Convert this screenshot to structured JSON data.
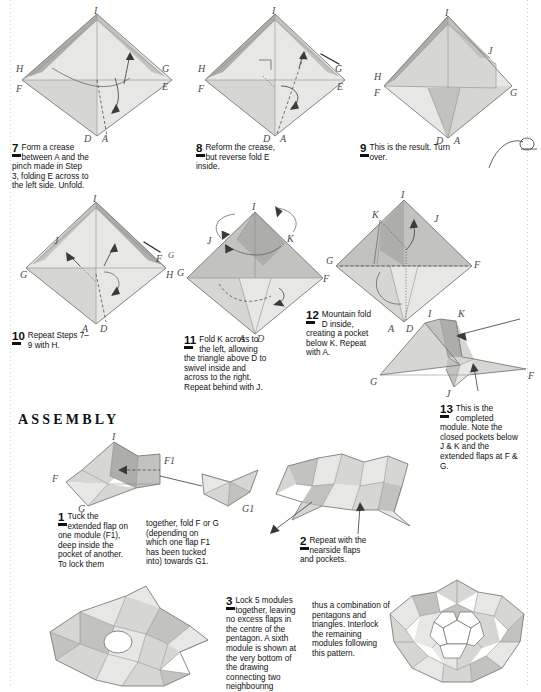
{
  "page": {
    "section_heading": "ASSEMBLY"
  },
  "steps": [
    {
      "number": "7",
      "text": "Form a crease between A and the pinch made in Step 3, folding E across to the left side. Unfold.",
      "labels": [
        "I",
        "H",
        "G",
        "F",
        "E",
        "D",
        "A"
      ]
    },
    {
      "number": "8",
      "text": "Reform the crease, but reverse fold E inside.",
      "labels": [
        "I",
        "H",
        "G",
        "F",
        "E",
        "D",
        "A"
      ]
    },
    {
      "number": "9",
      "text": "This is the result. Turn over.",
      "labels": [
        "I",
        "J",
        "H",
        "G",
        "F",
        "D",
        "A"
      ]
    },
    {
      "number": "10",
      "text": "Repeat Steps 7–9 with H.",
      "labels": [
        "I",
        "J",
        "G",
        "F",
        "G",
        "H",
        "A",
        "D"
      ]
    },
    {
      "number": "11",
      "text": "Fold K across to the left, allowing the triangle above D to swivel inside and across to the right. Repeat behind with J.",
      "labels": [
        "I",
        "J",
        "K",
        "G",
        "F",
        "A",
        "D"
      ]
    },
    {
      "number": "12",
      "text": "Mountain fold D inside, creating a pocket below K. Repeat with A.",
      "labels": [
        "I",
        "K",
        "J",
        "G",
        "F",
        "A",
        "D"
      ]
    },
    {
      "number": "13",
      "text": "This is the completed module. Note the closed pockets below J & K and the extended flaps at F & G.",
      "labels": [
        "I",
        "K",
        "G",
        "F",
        "J"
      ]
    }
  ],
  "assembly_steps": [
    {
      "number": "1",
      "text": "Tuck the extended flap on one module (F1), deep inside the pocket of another. To lock them",
      "continuation": "together, fold F or G (depending on which one flap F1 has been tucked into) towards G1.",
      "labels": [
        "I",
        "F",
        "G",
        "F1",
        "G1"
      ]
    },
    {
      "number": "2",
      "text": "Repeat with the nearside flaps and pockets.",
      "labels": []
    },
    {
      "number": "3",
      "text": "Lock 5 modules together, leaving no excess flaps in the centre of the pentagon. A sixth module is shown at the very bottom of the drawing connecting two neighbouring",
      "continuation": "thus a combination of pentagons and triangles. Interlock the remaining modules following this pattern.",
      "labels": []
    }
  ],
  "colors": {
    "paper_light": "#e7e7e5",
    "paper_mid": "#d6d6d3",
    "paper_dark": "#c2c2be",
    "paper_deep": "#adadaa",
    "ink": "#1a1a1a",
    "pencil": "#4a4a4a"
  }
}
